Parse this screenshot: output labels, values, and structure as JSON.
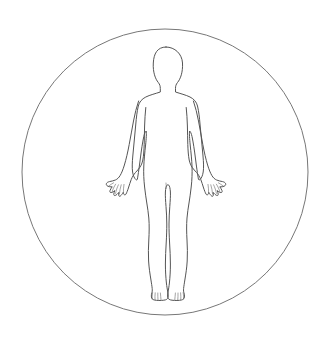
{
  "diagram": {
    "view": "anterior",
    "pose": "standing, arms abducted and slightly away from torso, palms forward, legs together",
    "canvas": {
      "width": 332,
      "height": 348,
      "background_color": "#ffffff"
    },
    "style": {
      "fill": "none",
      "body_stroke_color": "#555555",
      "circle_stroke_color": "#777777",
      "detail_stroke_color": "#666666",
      "body_stroke_width": 1.0,
      "circle_stroke_width": 1.0,
      "detail_stroke_width": 0.6
    },
    "enclosing_circle": {
      "name": "enclosing-circle",
      "center_x": 165,
      "center_y": 172,
      "radius": 143,
      "filled": false
    },
    "figure_bounds": {
      "top_of_head_y": 47,
      "bottom_of_feet_y": 301,
      "left_fingertip_x": 106,
      "right_fingertip_x": 225,
      "shoulder_left_x": 136,
      "shoulder_right_x": 196,
      "center_x": 166
    },
    "body_parts": [
      {
        "name": "head",
        "label": "Head"
      },
      {
        "name": "neck",
        "label": "Neck"
      },
      {
        "name": "shoulders",
        "label": "Shoulders"
      },
      {
        "name": "torso",
        "label": "Torso"
      },
      {
        "name": "left-arm",
        "label": "Left arm"
      },
      {
        "name": "right-arm",
        "label": "Right arm"
      },
      {
        "name": "left-hand",
        "label": "Left hand"
      },
      {
        "name": "right-hand",
        "label": "Right hand"
      },
      {
        "name": "left-leg",
        "label": "Left leg"
      },
      {
        "name": "right-leg",
        "label": "Right leg"
      },
      {
        "name": "left-foot",
        "label": "Left foot"
      },
      {
        "name": "right-foot",
        "label": "Right foot"
      }
    ]
  }
}
